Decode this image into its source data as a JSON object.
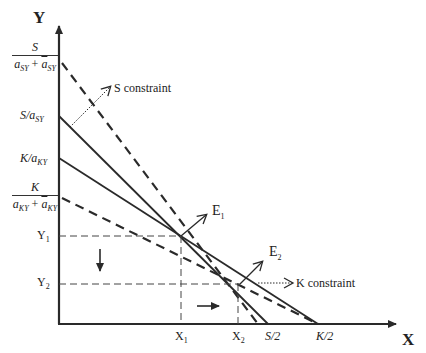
{
  "axes": {
    "y_label": "Y",
    "x_label": "X"
  },
  "y_ticks": {
    "s_dashed": {
      "num": "S",
      "den_a": "a",
      "den_a_sub": "SY",
      "den_plus": " + ",
      "den_hat": "a",
      "den_hat_sub": "SY"
    },
    "s_solid": {
      "text": "S/a",
      "sub": "SY"
    },
    "k_solid": {
      "text": "K/a",
      "sub": "KY"
    },
    "k_dashed": {
      "num": "K",
      "den_a": "a",
      "den_a_sub": "KY",
      "den_plus": " + ",
      "den_hat": "a",
      "den_hat_sub": "KY"
    },
    "y1": {
      "text": "Y",
      "sub": "1"
    },
    "y2": {
      "text": "Y",
      "sub": "2"
    }
  },
  "x_ticks": {
    "x1": {
      "text": "X",
      "sub": "1"
    },
    "x2": {
      "text": "X",
      "sub": "2"
    },
    "s_half": "S/2",
    "k_half": "K/2"
  },
  "annotations": {
    "s_constraint": "S constraint",
    "k_constraint": "K constraint",
    "e1": {
      "text": "E",
      "sub": "1"
    },
    "e2": {
      "text": "E",
      "sub": "2"
    }
  },
  "lines": {
    "s_solid": {
      "style": "solid",
      "from": [
        59,
        116
      ],
      "to": [
        268,
        324
      ]
    },
    "k_solid": {
      "style": "solid",
      "from": [
        59,
        158
      ],
      "to": [
        318,
        324
      ]
    },
    "s_dashed": {
      "style": "dashed",
      "from": [
        62,
        63
      ],
      "to": [
        258,
        324
      ]
    },
    "k_dashed": {
      "style": "dashed",
      "from": [
        62,
        198
      ],
      "to": [
        318,
        324
      ]
    }
  },
  "points": {
    "E1": [
      181,
      236
    ],
    "E2": [
      240,
      284
    ]
  },
  "colors": {
    "line": "#2a2a2a",
    "background": "#ffffff"
  }
}
